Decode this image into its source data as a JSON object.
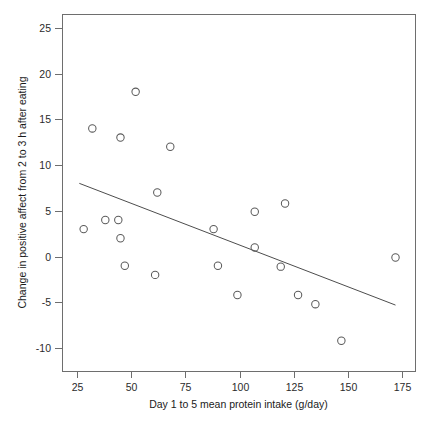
{
  "chart_data": {
    "type": "scatter",
    "title": "",
    "xlabel": "Day 1 to 5 mean protein intake (g/day)",
    "ylabel": "Change in positive affect from 2 to 3 h after eating",
    "xlim": [
      18,
      181
    ],
    "ylim": [
      -12.5,
      26.5
    ],
    "xticks": [
      25,
      50,
      75,
      100,
      125,
      150,
      175
    ],
    "xticklabels": [
      "25",
      "50",
      "75",
      "100",
      "125",
      "150",
      "175"
    ],
    "yticks": [
      25,
      20,
      15,
      10,
      5,
      0,
      -5,
      -10
    ],
    "yticklabels": [
      "25",
      "20",
      "15",
      "10",
      "5",
      "0",
      "-5",
      "-10"
    ],
    "grid": false,
    "legend": null,
    "marker": "open-circle",
    "marker_color": "#5a5a5a",
    "line_color": "#4d4d4d",
    "frame": true,
    "points": [
      {
        "x": 28,
        "y": 3
      },
      {
        "x": 32,
        "y": 14
      },
      {
        "x": 38,
        "y": 4
      },
      {
        "x": 44,
        "y": 4
      },
      {
        "x": 45,
        "y": 13
      },
      {
        "x": 45,
        "y": 2
      },
      {
        "x": 47,
        "y": -1
      },
      {
        "x": 52,
        "y": 18
      },
      {
        "x": 61,
        "y": -2
      },
      {
        "x": 62,
        "y": 7
      },
      {
        "x": 68,
        "y": 12
      },
      {
        "x": 88,
        "y": 3
      },
      {
        "x": 90,
        "y": -1
      },
      {
        "x": 99,
        "y": -4.2
      },
      {
        "x": 107,
        "y": 1
      },
      {
        "x": 107,
        "y": 4.9
      },
      {
        "x": 119,
        "y": -1.1
      },
      {
        "x": 121,
        "y": 5.8
      },
      {
        "x": 127,
        "y": -4.2
      },
      {
        "x": 135,
        "y": -5.2
      },
      {
        "x": 147,
        "y": -9.2
      },
      {
        "x": 172,
        "y": -0.1
      }
    ],
    "fit_line": {
      "x0": 26,
      "y0": 8.0,
      "x1": 172,
      "y1": -5.3,
      "slope": -0.0911,
      "intercept": 10.37
    }
  }
}
